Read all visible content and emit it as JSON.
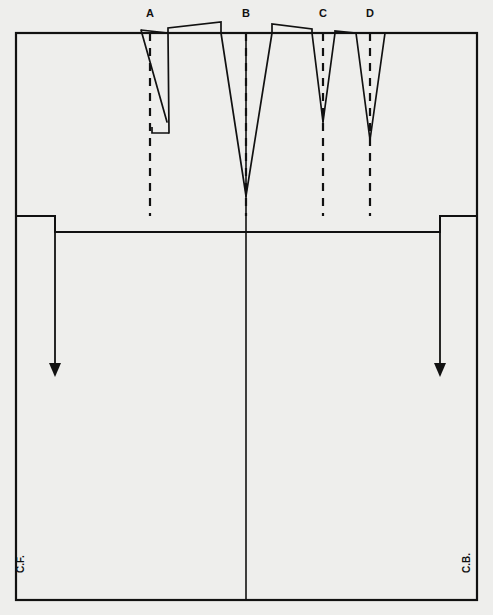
{
  "figure": {
    "background_color": "#eeeeec",
    "line_color": "#111111",
    "canvas": {
      "width": 493,
      "height": 615
    }
  },
  "frame": {
    "name": "pattern-outline",
    "left": 16,
    "right": 477,
    "top": 33,
    "bottom": 600,
    "waist_line_y": 216,
    "center_line_x": 246
  },
  "dart_labels": [
    {
      "id": "A",
      "text": "A",
      "x": 150,
      "y": 17
    },
    {
      "id": "B",
      "text": "B",
      "x": 246,
      "y": 17
    },
    {
      "id": "C",
      "text": "C",
      "x": 323,
      "y": 17
    },
    {
      "id": "D",
      "text": "D",
      "x": 370,
      "y": 17
    }
  ],
  "darts": [
    {
      "id": "A",
      "name": "dart-a",
      "center_x": 150,
      "top_y": 33,
      "apex_y": 133,
      "left_leg": {
        "x1": 141,
        "y1": 30,
        "x2": 167,
        "y2": 122
      },
      "right_leg": {
        "x1": 168,
        "y1": 33,
        "x2": 169,
        "y2": 133
      },
      "notch": {
        "x1": 169,
        "y1": 133,
        "x2": 152,
        "y2": 133,
        "x3": 152,
        "y3": 127
      },
      "dash_line": {
        "x": 150,
        "y1": 33,
        "y2": 216
      }
    },
    {
      "id": "B",
      "name": "dart-b",
      "center_x": 246,
      "top_y": 33,
      "apex_y": 196,
      "left_leg": {
        "x1": 221,
        "y1": 33,
        "x2": 246,
        "y2": 196
      },
      "right_leg": {
        "x1": 272,
        "y1": 33,
        "x2": 246,
        "y2": 196
      },
      "dash_line": {
        "x": 246,
        "y1": 33,
        "y2": 216
      }
    },
    {
      "id": "C",
      "name": "dart-c",
      "center_x": 323,
      "top_y": 33,
      "apex_y": 122,
      "left_leg": {
        "x1": 312,
        "y1": 33,
        "x2": 323,
        "y2": 122
      },
      "right_leg": {
        "x1": 335,
        "y1": 33,
        "x2": 323,
        "y2": 122
      },
      "dash_line": {
        "x": 323,
        "y1": 33,
        "y2": 216
      }
    },
    {
      "id": "D",
      "name": "dart-d",
      "center_x": 370,
      "top_y": 33,
      "apex_y": 140,
      "left_leg": {
        "x1": 356,
        "y1": 33,
        "x2": 370,
        "y2": 140
      },
      "right_leg": {
        "x1": 385,
        "y1": 33,
        "x2": 370,
        "y2": 140
      },
      "dash_line": {
        "x": 370,
        "y1": 33,
        "y2": 216
      }
    }
  ],
  "shoulder_segments": [
    {
      "name": "shoulder-rise-left",
      "points": "141,30 168,33 168,28 221,22 221,33"
    },
    {
      "name": "shoulder-rise-right",
      "points": "272,33 272,24 312,29 312,33"
    },
    {
      "name": "shoulder-rise-center-right",
      "points": "335,33 335,31 356,33"
    }
  ],
  "grain_arrows": [
    {
      "name": "grain-arrow-front",
      "x": 55,
      "y_top": 216,
      "y_bottom": 377,
      "head_width": 12,
      "head_height": 14
    },
    {
      "name": "grain-arrow-back",
      "x": 440,
      "y_top": 216,
      "y_bottom": 377,
      "head_width": 12,
      "head_height": 14
    }
  ],
  "hem_stubs": [
    {
      "name": "hem-stub-left",
      "x": 55,
      "y1": 216,
      "y2": 232
    },
    {
      "name": "hem-stub-right",
      "x": 440,
      "y1": 216,
      "y2": 232
    }
  ],
  "skirt_step_line": {
    "name": "skirt-step-line",
    "points": "16,216 55,216 55,232 440,232 440,216 477,216"
  },
  "edge_labels": [
    {
      "id": "CF",
      "name": "center-front-label",
      "text": "C.F.",
      "x": 24,
      "y": 573
    },
    {
      "id": "CB",
      "name": "center-back-label",
      "text": "C.B.",
      "x": 470,
      "y": 573
    }
  ]
}
